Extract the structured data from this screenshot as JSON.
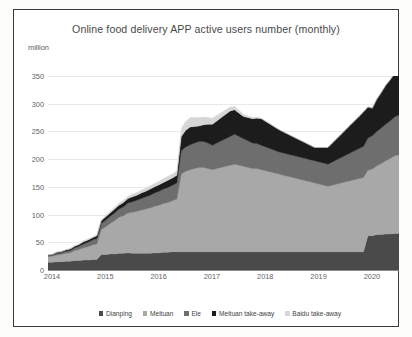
{
  "chart_data": {
    "type": "area",
    "title": "Online food delivery APP active users number (monthly)",
    "xlabel": "",
    "ylabel": "million",
    "ylim": [
      0,
      350
    ],
    "yticks": [
      0,
      50,
      100,
      150,
      200,
      250,
      300,
      350
    ],
    "xticks": [
      "2014",
      "2015",
      "2016",
      "2017",
      "2018",
      "2019",
      "2020"
    ],
    "grid": true,
    "legend_position": "bottom",
    "stacked": true,
    "x": [
      "2014-01",
      "2014-02",
      "2014-03",
      "2014-04",
      "2014-05",
      "2014-06",
      "2014-07",
      "2014-08",
      "2014-09",
      "2014-10",
      "2014-11",
      "2014-12",
      "2015-01",
      "2015-02",
      "2015-03",
      "2015-04",
      "2015-05",
      "2015-06",
      "2015-07",
      "2015-08",
      "2015-09",
      "2015-10",
      "2015-11",
      "2015-12",
      "2016-01",
      "2016-02",
      "2016-03",
      "2016-04",
      "2016-05",
      "2016-06",
      "2016-07",
      "2016-08",
      "2016-09",
      "2016-10",
      "2016-11",
      "2016-12",
      "2017-01",
      "2017-02",
      "2017-03",
      "2017-04",
      "2017-05",
      "2017-06",
      "2017-07",
      "2017-08",
      "2017-09",
      "2017-10",
      "2017-11",
      "2017-12",
      "2018-01",
      "2018-02",
      "2018-03",
      "2018-04",
      "2018-05",
      "2018-06",
      "2018-07",
      "2018-08",
      "2018-09",
      "2018-10",
      "2018-11",
      "2018-12",
      "2019-01",
      "2019-02",
      "2019-03",
      "2019-04",
      "2019-05",
      "2019-06",
      "2019-07",
      "2019-08",
      "2019-09",
      "2019-10",
      "2019-11",
      "2019-12",
      "2020-01",
      "2020-02",
      "2020-03",
      "2020-04",
      "2020-05",
      "2020-06",
      "2020-07",
      "2020-08"
    ],
    "series": [
      {
        "name": "Dianping",
        "color": "#4a4a4a",
        "values": [
          14,
          14,
          15,
          15,
          16,
          16,
          17,
          17,
          18,
          18,
          19,
          19,
          28,
          28,
          29,
          29,
          30,
          30,
          31,
          30,
          30,
          30,
          30,
          30,
          31,
          31,
          32,
          32,
          33,
          33,
          33,
          33,
          33,
          33,
          33,
          33,
          33,
          33,
          33,
          33,
          33,
          33,
          33,
          33,
          33,
          33,
          33,
          33,
          33,
          33,
          33,
          33,
          33,
          33,
          33,
          33,
          33,
          33,
          33,
          33,
          33,
          33,
          33,
          33,
          33,
          33,
          33,
          33,
          33,
          33,
          33,
          33,
          62,
          62,
          64,
          64,
          65,
          65,
          66,
          66
        ]
      },
      {
        "name": "Meituan",
        "color": "#a8a8a8",
        "values": [
          10,
          11,
          12,
          13,
          14,
          15,
          18,
          20,
          22,
          24,
          26,
          28,
          45,
          50,
          55,
          60,
          65,
          68,
          72,
          74,
          76,
          78,
          80,
          82,
          84,
          86,
          88,
          90,
          92,
          95,
          140,
          145,
          148,
          150,
          152,
          152,
          150,
          148,
          150,
          152,
          154,
          156,
          158,
          156,
          154,
          152,
          150,
          150,
          148,
          146,
          144,
          142,
          140,
          138,
          136,
          134,
          132,
          130,
          128,
          126,
          124,
          122,
          120,
          118,
          120,
          122,
          124,
          126,
          128,
          130,
          132,
          134,
          118,
          120,
          124,
          128,
          132,
          136,
          140,
          142
        ]
      },
      {
        "name": "Ele",
        "color": "#6e6e6e",
        "values": [
          2,
          2,
          3,
          3,
          4,
          4,
          5,
          6,
          7,
          8,
          9,
          10,
          11,
          12,
          13,
          14,
          15,
          16,
          18,
          19,
          20,
          21,
          22,
          23,
          24,
          25,
          26,
          27,
          28,
          29,
          42,
          44,
          45,
          46,
          47,
          47,
          46,
          44,
          46,
          48,
          50,
          52,
          54,
          52,
          50,
          48,
          46,
          45,
          44,
          43,
          42,
          41,
          40,
          40,
          40,
          40,
          40,
          40,
          40,
          40,
          40,
          40,
          40,
          40,
          42,
          44,
          46,
          48,
          50,
          52,
          54,
          56,
          58,
          60,
          62,
          64,
          66,
          68,
          70,
          72
        ]
      },
      {
        "name": "Meituan take-away",
        "color": "#1c1c1c",
        "values": [
          1,
          1,
          2,
          2,
          2,
          3,
          3,
          3,
          4,
          4,
          4,
          5,
          5,
          6,
          6,
          7,
          7,
          8,
          8,
          9,
          9,
          10,
          10,
          11,
          11,
          12,
          12,
          13,
          13,
          14,
          26,
          30,
          32,
          30,
          28,
          30,
          34,
          38,
          40,
          42,
          44,
          46,
          44,
          42,
          40,
          42,
          44,
          46,
          48,
          46,
          44,
          42,
          40,
          38,
          36,
          34,
          32,
          30,
          28,
          26,
          24,
          26,
          28,
          30,
          34,
          38,
          42,
          46,
          50,
          54,
          58,
          62,
          56,
          50,
          58,
          64,
          70,
          74,
          78,
          80
        ]
      },
      {
        "name": "Baidu take-away",
        "color": "#d6d6d6",
        "values": [
          0,
          0,
          0,
          0,
          1,
          1,
          1,
          1,
          2,
          2,
          2,
          2,
          2,
          3,
          3,
          3,
          4,
          4,
          4,
          5,
          5,
          5,
          6,
          6,
          6,
          6,
          7,
          7,
          7,
          8,
          14,
          16,
          17,
          16,
          15,
          14,
          12,
          11,
          10,
          9,
          8,
          7,
          6,
          5,
          4,
          3,
          2,
          2,
          1,
          1,
          1,
          1,
          1,
          0,
          0,
          0,
          0,
          0,
          0,
          0,
          0,
          0,
          0,
          0,
          0,
          0,
          0,
          0,
          0,
          0,
          0,
          0,
          0,
          0,
          0,
          0,
          0,
          0,
          0,
          0
        ]
      }
    ]
  },
  "legend": {
    "items": [
      {
        "label": "Dianping",
        "color": "#4a4a4a"
      },
      {
        "label": "Meituan",
        "color": "#a8a8a8"
      },
      {
        "label": "Ele",
        "color": "#6e6e6e"
      },
      {
        "label": "Meituan take-away",
        "color": "#1c1c1c"
      },
      {
        "label": "Baidu take-away",
        "color": "#d6d6d6"
      }
    ]
  }
}
